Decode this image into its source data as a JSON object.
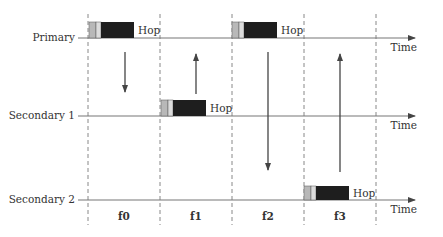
{
  "diagram": {
    "type": "frequency-hopping-timeline",
    "axis_label": "Time",
    "hop_label": "Hop",
    "channels": [
      {
        "name": "Primary",
        "y": 38
      },
      {
        "name": "Secondary 1",
        "y": 116
      },
      {
        "name": "Secondary 2",
        "y": 200
      }
    ],
    "frames": [
      {
        "label": "f0",
        "x_start": 88,
        "x_end": 160
      },
      {
        "label": "f1",
        "x_start": 160,
        "x_end": 232
      },
      {
        "label": "f2",
        "x_start": 232,
        "x_end": 304
      },
      {
        "label": "f3",
        "x_start": 304,
        "x_end": 376
      }
    ],
    "hops": [
      {
        "frame": "f0",
        "channel": "Primary"
      },
      {
        "frame": "f1",
        "channel": "Secondary 1"
      },
      {
        "frame": "f2",
        "channel": "Primary"
      },
      {
        "frame": "f3",
        "channel": "Secondary 2"
      }
    ],
    "arrows": [
      {
        "frame": "f0",
        "direction": "down",
        "from": "Primary",
        "to": "Secondary 1"
      },
      {
        "frame": "f1",
        "direction": "up",
        "from": "Secondary 1",
        "to": "Primary"
      },
      {
        "frame": "f2",
        "direction": "down",
        "from": "Primary",
        "to": "Secondary 2"
      },
      {
        "frame": "f3",
        "direction": "up",
        "from": "Secondary 2",
        "to": "Primary"
      }
    ],
    "colors": {
      "line": "#777777",
      "packet_light": "#b8b8b8",
      "packet_mid": "#dcdcdc",
      "packet_dark": "#1e1e1e",
      "text": "#333333"
    }
  }
}
